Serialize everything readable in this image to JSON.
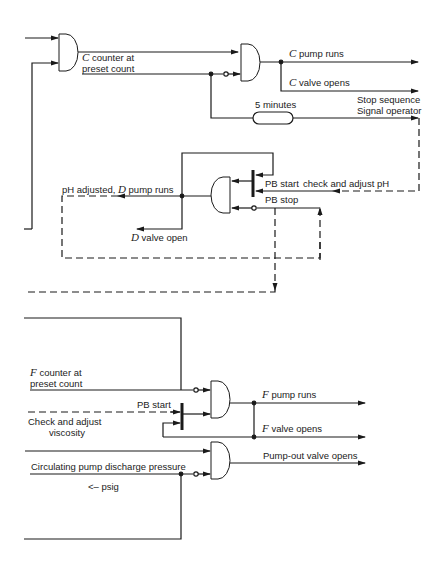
{
  "diagram": {
    "type": "logic-sequence-diagram",
    "section_top": {
      "gate1_inputs": [],
      "c_counter_label": "counter at",
      "c_counter_label_prefix": "C",
      "c_counter_label_line2": "preset count",
      "c_pump_prefix": "C",
      "c_pump_label": "pump runs",
      "c_valve_prefix": "C",
      "c_valve_label": "valve opens",
      "timer_label": "5 minutes",
      "stop_label_line1": "Stop sequence",
      "stop_label_line2": "Signal operator"
    },
    "section_middle": {
      "ph_label_prefix": "pH adjusted,",
      "ph_label_d": "D",
      "ph_label_suffix": "pump runs",
      "d_valve_prefix": "D",
      "d_valve_label": "valve open",
      "pb_start_label": "PB start",
      "check_ph_label": "check and adjust pH",
      "pb_stop_label": "PB stop"
    },
    "section_bottom": {
      "f_counter_prefix": "F",
      "f_counter_label": "counter at",
      "f_counter_label_line2": "preset count",
      "pb_start_label": "PB start",
      "viscosity_line1": "Check and adjust",
      "viscosity_line2": "viscosity",
      "f_pump_prefix": "F",
      "f_pump_label": "pump runs",
      "f_valve_prefix": "F",
      "f_valve_label": "valve opens",
      "pressure_label": "Circulating pump discharge pressure",
      "psig_label": "<– psig",
      "pumpout_label": "Pump-out valve opens"
    },
    "colors": {
      "line": "#1a1a1a",
      "background": "#ffffff"
    }
  }
}
